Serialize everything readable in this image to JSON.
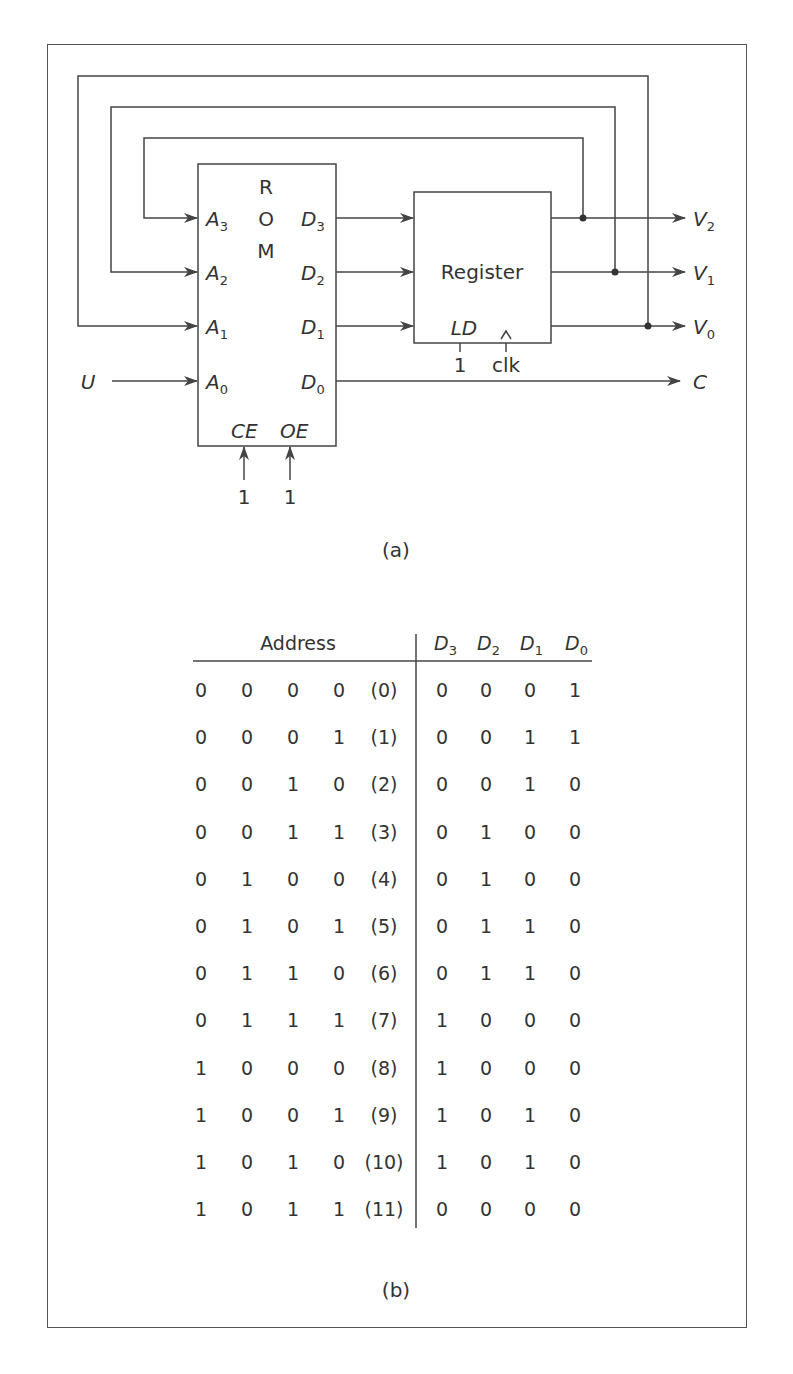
{
  "figure": {
    "part_a": {
      "caption": "(a)",
      "rom": {
        "title_letters": [
          "R",
          "O",
          "M"
        ],
        "inputs": [
          {
            "name": "A",
            "sub": "3"
          },
          {
            "name": "A",
            "sub": "2"
          },
          {
            "name": "A",
            "sub": "1"
          },
          {
            "name": "A",
            "sub": "0"
          }
        ],
        "outputs": [
          {
            "name": "D",
            "sub": "3"
          },
          {
            "name": "D",
            "sub": "2"
          },
          {
            "name": "D",
            "sub": "1"
          },
          {
            "name": "D",
            "sub": "0"
          }
        ],
        "control_labels": [
          "CE",
          "OE"
        ],
        "control_values": [
          "1",
          "1"
        ]
      },
      "register": {
        "title": "Register",
        "load_label": "LD",
        "load_value": "1",
        "clock_label": "clk"
      },
      "external_input": "U",
      "outputs": [
        {
          "name": "V",
          "sub": "2"
        },
        {
          "name": "V",
          "sub": "1"
        },
        {
          "name": "V",
          "sub": "0"
        }
      ],
      "carry_output": "C"
    },
    "part_b": {
      "caption": "(b)",
      "table": {
        "address_header": "Address",
        "data_headers": [
          {
            "name": "D",
            "sub": "3"
          },
          {
            "name": "D",
            "sub": "2"
          },
          {
            "name": "D",
            "sub": "1"
          },
          {
            "name": "D",
            "sub": "0"
          }
        ],
        "rows": [
          {
            "address": [
              "0",
              "0",
              "0",
              "0"
            ],
            "index": "(0)",
            "data": [
              "0",
              "0",
              "0",
              "1"
            ]
          },
          {
            "address": [
              "0",
              "0",
              "0",
              "1"
            ],
            "index": "(1)",
            "data": [
              "0",
              "0",
              "1",
              "1"
            ]
          },
          {
            "address": [
              "0",
              "0",
              "1",
              "0"
            ],
            "index": "(2)",
            "data": [
              "0",
              "0",
              "1",
              "0"
            ]
          },
          {
            "address": [
              "0",
              "0",
              "1",
              "1"
            ],
            "index": "(3)",
            "data": [
              "0",
              "1",
              "0",
              "0"
            ]
          },
          {
            "address": [
              "0",
              "1",
              "0",
              "0"
            ],
            "index": "(4)",
            "data": [
              "0",
              "1",
              "0",
              "0"
            ]
          },
          {
            "address": [
              "0",
              "1",
              "0",
              "1"
            ],
            "index": "(5)",
            "data": [
              "0",
              "1",
              "1",
              "0"
            ]
          },
          {
            "address": [
              "0",
              "1",
              "1",
              "0"
            ],
            "index": "(6)",
            "data": [
              "0",
              "1",
              "1",
              "0"
            ]
          },
          {
            "address": [
              "0",
              "1",
              "1",
              "1"
            ],
            "index": "(7)",
            "data": [
              "1",
              "0",
              "0",
              "0"
            ]
          },
          {
            "address": [
              "1",
              "0",
              "0",
              "0"
            ],
            "index": "(8)",
            "data": [
              "1",
              "0",
              "0",
              "0"
            ]
          },
          {
            "address": [
              "1",
              "0",
              "0",
              "1"
            ],
            "index": "(9)",
            "data": [
              "1",
              "0",
              "1",
              "0"
            ]
          },
          {
            "address": [
              "1",
              "0",
              "1",
              "0"
            ],
            "index": "(10)",
            "data": [
              "1",
              "0",
              "1",
              "0"
            ]
          },
          {
            "address": [
              "1",
              "0",
              "1",
              "1"
            ],
            "index": "(11)",
            "data": [
              "0",
              "0",
              "0",
              "0"
            ]
          }
        ]
      }
    },
    "colors": {
      "line": "#444444",
      "text": "#333333",
      "background": "#ffffff"
    }
  }
}
